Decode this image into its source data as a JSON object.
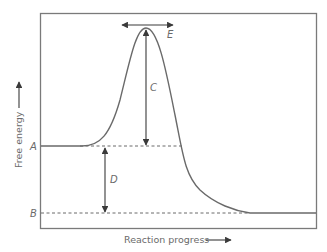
{
  "diagram": {
    "type": "reaction-energy-profile",
    "x_axis_label": "Reaction progress",
    "y_axis_label": "Free energy",
    "labels": {
      "A": "A",
      "B": "B",
      "C": "C",
      "D": "D",
      "E": "E"
    },
    "colors": {
      "line": "#6a6a6a",
      "frame": "#7a7a7a",
      "text": "#6a6a6a"
    }
  }
}
